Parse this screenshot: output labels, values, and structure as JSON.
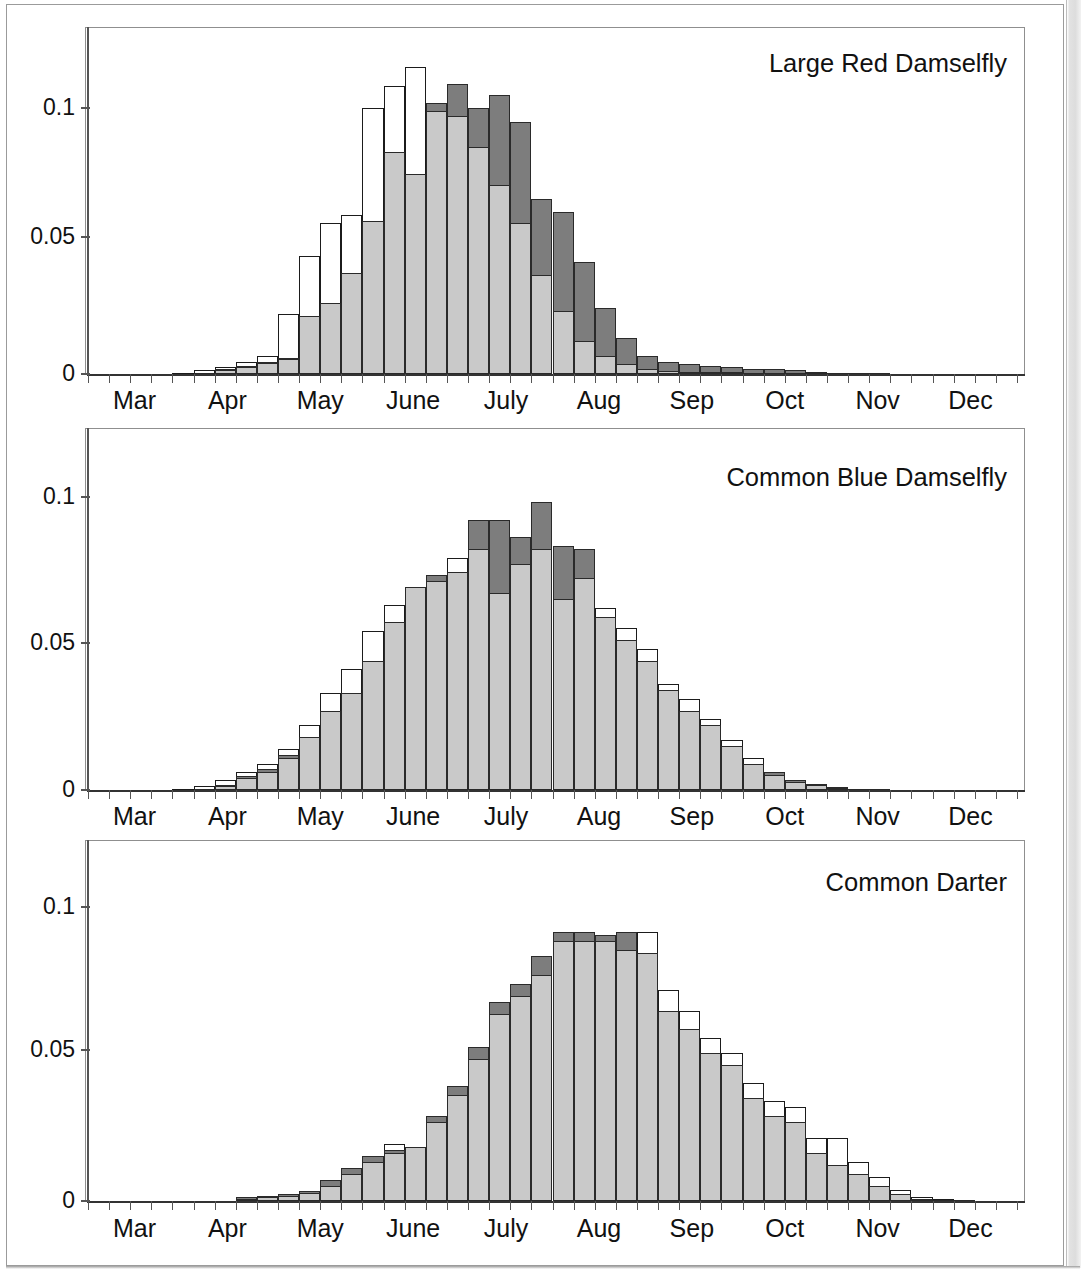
{
  "figure": {
    "months": [
      "Mar",
      "Apr",
      "May",
      "June",
      "July",
      "Aug",
      "Sep",
      "Oct",
      "Nov",
      "Dec"
    ],
    "y_ticks": [
      "0",
      "0.05",
      "0.1"
    ],
    "y_tick_values": [
      0,
      0.05,
      0.1
    ]
  },
  "panels": [
    {
      "title": "Large Red Damselfly"
    },
    {
      "title": "Common Blue Damselfly"
    },
    {
      "title": "Common Darter"
    }
  ],
  "chart_data": [
    {
      "type": "bar",
      "title": "Large Red Damselfly",
      "subtitle": "",
      "xlabel": "",
      "ylabel": "",
      "ylim": [
        0,
        0.125
      ],
      "grid": false,
      "legend": "none",
      "bin_width_label": "week",
      "categories": [
        "Mar",
        "Apr",
        "May",
        "June",
        "July",
        "Aug",
        "Sep",
        "Oct",
        "Nov",
        "Dec"
      ],
      "x": [
        1,
        2,
        3,
        4,
        5,
        6,
        7,
        8,
        9,
        10,
        11,
        12,
        13,
        14,
        15,
        16,
        17,
        18,
        19,
        20,
        21,
        22,
        23,
        24,
        25,
        26,
        27,
        28,
        29,
        30,
        31,
        32,
        33,
        34,
        35,
        36,
        37,
        38,
        39,
        40,
        41,
        42,
        43,
        44
      ],
      "series": [
        {
          "name": "light-gray-filled",
          "values": [
            0,
            0,
            0,
            0,
            0,
            0.0005,
            0.0015,
            0.0025,
            0.004,
            0.0055,
            0.021,
            0.026,
            0.037,
            0.056,
            0.081,
            0.073,
            0.096,
            0.094,
            0.083,
            0.069,
            0.055,
            0.036,
            0.023,
            0.012,
            0.0065,
            0.0035,
            0.0018,
            0.0012,
            0.0008,
            0.0007,
            0.0006,
            0.0005,
            0.0004,
            0.0003,
            0.0002,
            0.0002,
            0.0001,
            0.0001,
            0,
            0,
            0,
            0,
            0,
            0
          ]
        },
        {
          "name": "dark-gray-overlay",
          "values": [
            0,
            0,
            0,
            0,
            0,
            0.0005,
            0.0018,
            0.003,
            0.0045,
            0.006,
            0.021,
            0.026,
            0.037,
            0.056,
            0.081,
            0.073,
            0.099,
            0.106,
            0.097,
            0.102,
            0.092,
            0.064,
            0.059,
            0.041,
            0.024,
            0.013,
            0.0065,
            0.0045,
            0.0035,
            0.003,
            0.0025,
            0.002,
            0.0018,
            0.0015,
            0.0008,
            0.0005,
            0.0003,
            0.0002,
            0,
            0,
            0,
            0,
            0,
            0
          ]
        },
        {
          "name": "white-outline",
          "values": [
            0,
            0,
            0,
            0,
            0.0005,
            0.0015,
            0.0025,
            0.0045,
            0.0065,
            0.022,
            0.043,
            0.055,
            0.058,
            0.097,
            0.105,
            0.112,
            0.099,
            0.096,
            0.082,
            0.068,
            0.055,
            0.036,
            0.023,
            0.012,
            0.0065,
            0.0035,
            0.0018,
            0.0012,
            0.0008,
            0.0007,
            0.0006,
            0.0005,
            0.0004,
            0.0003,
            0.0002,
            0.0002,
            0.0001,
            0.0001,
            0,
            0,
            0,
            0,
            0,
            0
          ]
        }
      ]
    },
    {
      "type": "bar",
      "title": "Common Blue Damselfly",
      "subtitle": "",
      "xlabel": "",
      "ylabel": "",
      "ylim": [
        0,
        0.125
      ],
      "grid": false,
      "legend": "none",
      "bin_width_label": "week",
      "categories": [
        "Mar",
        "Apr",
        "May",
        "June",
        "July",
        "Aug",
        "Sep",
        "Oct",
        "Nov",
        "Dec"
      ],
      "x": [
        1,
        2,
        3,
        4,
        5,
        6,
        7,
        8,
        9,
        10,
        11,
        12,
        13,
        14,
        15,
        16,
        17,
        18,
        19,
        20,
        21,
        22,
        23,
        24,
        25,
        26,
        27,
        28,
        29,
        30,
        31,
        32,
        33,
        34,
        35,
        36,
        37,
        38,
        39,
        40,
        41,
        42,
        43,
        44
      ],
      "series": [
        {
          "name": "light-gray-filled",
          "values": [
            0,
            0,
            0,
            0,
            0,
            0.0004,
            0.0012,
            0.004,
            0.006,
            0.011,
            0.018,
            0.027,
            0.033,
            0.044,
            0.057,
            0.069,
            0.071,
            0.074,
            0.082,
            0.067,
            0.077,
            0.082,
            0.065,
            0.072,
            0.059,
            0.051,
            0.044,
            0.034,
            0.027,
            0.022,
            0.015,
            0.009,
            0.005,
            0.0028,
            0.0016,
            0.0008,
            0.0004,
            0.0002,
            0.0001,
            0,
            0,
            0,
            0,
            0
          ]
        },
        {
          "name": "dark-gray-overlay",
          "values": [
            0,
            0,
            0,
            0,
            0,
            0.0005,
            0.0018,
            0.0048,
            0.007,
            0.012,
            0.018,
            0.027,
            0.033,
            0.044,
            0.057,
            0.069,
            0.073,
            0.074,
            0.092,
            0.092,
            0.086,
            0.098,
            0.083,
            0.082,
            0.059,
            0.051,
            0.044,
            0.034,
            0.027,
            0.022,
            0.015,
            0.009,
            0.006,
            0.0035,
            0.002,
            0.001,
            0.0005,
            0.0002,
            0.0001,
            0,
            0,
            0,
            0,
            0
          ]
        },
        {
          "name": "white-outline",
          "values": [
            0,
            0,
            0,
            0,
            0.0004,
            0.0012,
            0.0035,
            0.006,
            0.009,
            0.014,
            0.022,
            0.033,
            0.041,
            0.054,
            0.063,
            0.069,
            0.071,
            0.079,
            0.082,
            0.067,
            0.077,
            0.082,
            0.065,
            0.072,
            0.062,
            0.055,
            0.048,
            0.036,
            0.031,
            0.024,
            0.017,
            0.011,
            0.006,
            0.0032,
            0.0018,
            0.0009,
            0.0004,
            0.0002,
            0.0001,
            0,
            0,
            0,
            0,
            0
          ]
        }
      ]
    },
    {
      "type": "bar",
      "title": "Common Darter",
      "subtitle": "",
      "xlabel": "",
      "ylabel": "",
      "ylim": [
        0,
        0.125
      ],
      "grid": false,
      "legend": "none",
      "bin_width_label": "week",
      "categories": [
        "Mar",
        "Apr",
        "May",
        "June",
        "July",
        "Aug",
        "Sep",
        "Oct",
        "Nov",
        "Dec"
      ],
      "x": [
        1,
        2,
        3,
        4,
        5,
        6,
        7,
        8,
        9,
        10,
        11,
        12,
        13,
        14,
        15,
        16,
        17,
        18,
        19,
        20,
        21,
        22,
        23,
        24,
        25,
        26,
        27,
        28,
        29,
        30,
        31,
        32,
        33,
        34,
        35,
        36,
        37,
        38,
        39,
        40,
        41,
        42,
        43,
        44
      ],
      "series": [
        {
          "name": "light-gray-filled",
          "values": [
            0,
            0,
            0,
            0,
            0,
            0,
            0,
            0.0008,
            0.0012,
            0.0018,
            0.0025,
            0.005,
            0.009,
            0.013,
            0.016,
            0.018,
            0.026,
            0.035,
            0.047,
            0.062,
            0.068,
            0.075,
            0.086,
            0.086,
            0.086,
            0.083,
            0.082,
            0.063,
            0.057,
            0.049,
            0.045,
            0.034,
            0.028,
            0.026,
            0.016,
            0.012,
            0.009,
            0.005,
            0.0022,
            0.0008,
            0.0004,
            0.0002,
            0,
            0
          ]
        },
        {
          "name": "dark-gray-overlay",
          "values": [
            0,
            0,
            0,
            0,
            0,
            0,
            0,
            0.0012,
            0.0016,
            0.0022,
            0.0032,
            0.007,
            0.011,
            0.015,
            0.017,
            0.018,
            0.028,
            0.038,
            0.051,
            0.066,
            0.072,
            0.081,
            0.089,
            0.089,
            0.088,
            0.089,
            0.082,
            0.063,
            0.057,
            0.049,
            0.045,
            0.034,
            0.028,
            0.026,
            0.016,
            0.012,
            0.009,
            0.005,
            0.0022,
            0.0008,
            0.0004,
            0.0002,
            0,
            0
          ]
        },
        {
          "name": "white-outline",
          "values": [
            0,
            0,
            0,
            0,
            0,
            0,
            0,
            0.0008,
            0.0012,
            0.0018,
            0.0025,
            0.005,
            0.009,
            0.013,
            0.019,
            0.018,
            0.026,
            0.035,
            0.047,
            0.062,
            0.068,
            0.075,
            0.086,
            0.086,
            0.086,
            0.089,
            0.089,
            0.07,
            0.063,
            0.054,
            0.049,
            0.039,
            0.033,
            0.031,
            0.021,
            0.021,
            0.013,
            0.008,
            0.0035,
            0.0012,
            0.0006,
            0.0003,
            0,
            0
          ]
        }
      ]
    }
  ]
}
